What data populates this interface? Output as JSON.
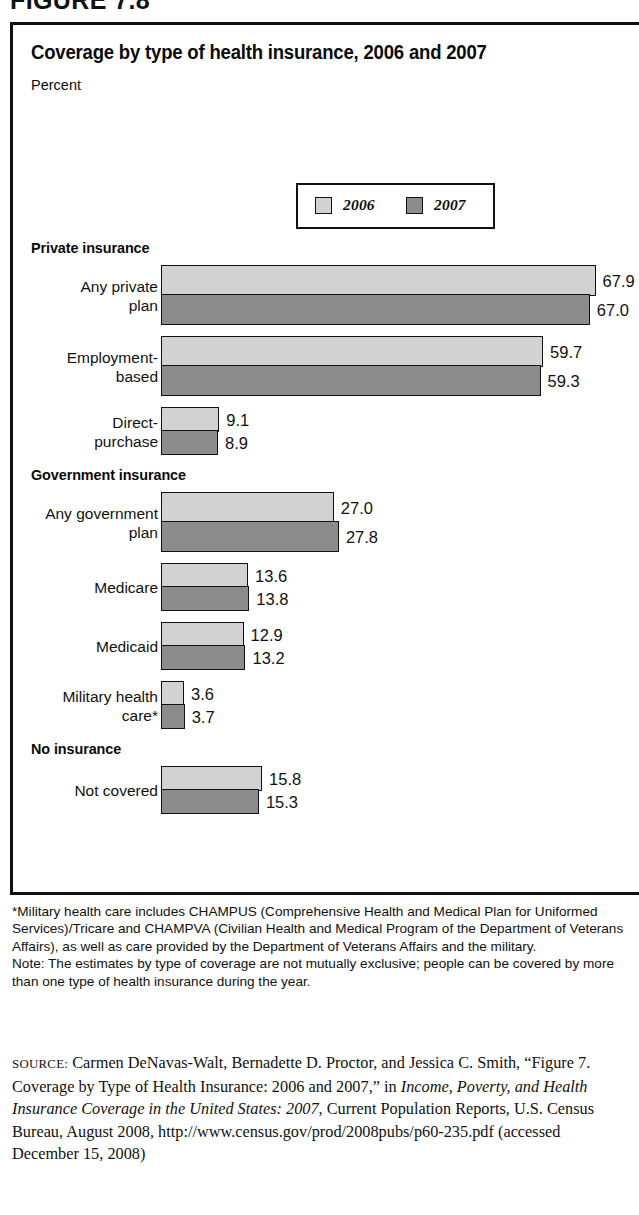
{
  "figure": {
    "caption": "FIGURE 7.8"
  },
  "chart": {
    "title": "Coverage by type of health insurance, 2006 and 2007",
    "subtitle": "Percent"
  },
  "legend": {
    "items": [
      {
        "label": "2006",
        "color": "#d2d2d2"
      },
      {
        "label": "2007",
        "color": "#8c8c8c"
      }
    ]
  },
  "chart_data": {
    "type": "bar",
    "orientation": "horizontal",
    "title": "Coverage by type of health insurance, 2006 and 2007",
    "xlabel": "Percent",
    "ylabel": "",
    "xlim": [
      0,
      67.9
    ],
    "grid": false,
    "legend_position": "top-center",
    "series": [
      {
        "name": "2006",
        "color": "#d2d2d2"
      },
      {
        "name": "2007",
        "color": "#8c8c8c"
      }
    ],
    "groups": [
      {
        "name": "Private insurance",
        "rows": [
          {
            "category": "Any private\nplan",
            "values": [
              67.9,
              67.0
            ]
          },
          {
            "category": "Employment-\nbased",
            "values": [
              59.7,
              59.3
            ]
          },
          {
            "category": "Direct-\npurchase",
            "values": [
              9.1,
              8.9
            ]
          }
        ]
      },
      {
        "name": "Government insurance",
        "rows": [
          {
            "category": "Any government\nplan",
            "values": [
              27.0,
              27.8
            ]
          },
          {
            "category": "Medicare",
            "values": [
              13.6,
              13.8
            ]
          },
          {
            "category": "Medicaid",
            "values": [
              12.9,
              13.2
            ]
          },
          {
            "category": "Military health\ncare*",
            "values": [
              3.6,
              3.7
            ]
          }
        ]
      },
      {
        "name": "No insurance",
        "rows": [
          {
            "category": "Not covered",
            "values": [
              15.8,
              15.3
            ]
          }
        ]
      }
    ]
  },
  "notes": {
    "footnote": "*Military health care includes CHAMPUS (Comprehensive Health and Medical Plan for Uniformed Services)/Tricare and CHAMPVA (Civilian Health and Medical Program of the Department of Veterans Affairs), as well as care provided by the Department of Veterans Affairs and the military.",
    "note": "Note: The estimates by type of coverage are not mutually exclusive; people can be covered by more than one type of health insurance during the year."
  },
  "source": {
    "kicker": "SOURCE:",
    "part1": " Carmen DeNavas-Walt, Bernadette D. Proctor, and Jessica C. Smith, “Figure 7. Coverage by Type of Health Insurance: 2006 and 2007,” in ",
    "italic1": "Income, Poverty, and Health Insurance Coverage in the United States: 2007",
    "part2": ", Current Population Reports, U.S. Census Bureau, August 2008, http://www.census.gov/prod/2008pubs/p60-235.pdf (accessed December 15, 2008)"
  }
}
